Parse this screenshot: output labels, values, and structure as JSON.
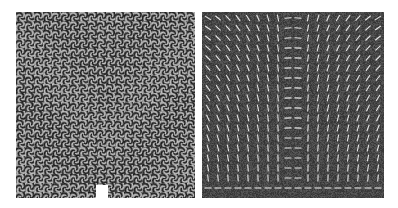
{
  "figure": {
    "panels": [
      {
        "id": "left",
        "description": "texture pattern of swirling pinwheel motifs converging toward bottom-center",
        "base_color": "#6e6e6e"
      },
      {
        "id": "right",
        "description": "vector field of short light line segments over noisy dark background, flowing toward bottom-center",
        "base_color": "#4a4a4a"
      }
    ]
  }
}
